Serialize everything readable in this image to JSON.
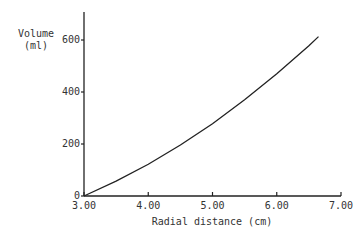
{
  "chart_data": {
    "type": "line",
    "title": "",
    "xlabel": "Radial distance (cm)",
    "ylabel": "Volume (ml)",
    "ylabel_lines": [
      "Volume",
      "(ml)"
    ],
    "xlim": [
      3.0,
      7.0
    ],
    "ylim": [
      0,
      600
    ],
    "grid": false,
    "legend": null,
    "x_ticks": [
      "3.00",
      "4.00",
      "5.00",
      "6.00",
      "7.00"
    ],
    "y_ticks": [
      "0",
      "200",
      "400",
      "600"
    ],
    "series": [
      {
        "name": "Volume",
        "x": [
          3.0,
          3.5,
          4.0,
          4.5,
          5.0,
          5.5,
          6.0,
          6.5,
          6.65
        ],
        "values": [
          0,
          57,
          122,
          196,
          278,
          370,
          470,
          578,
          613
        ]
      }
    ],
    "line_color": "#222222"
  }
}
